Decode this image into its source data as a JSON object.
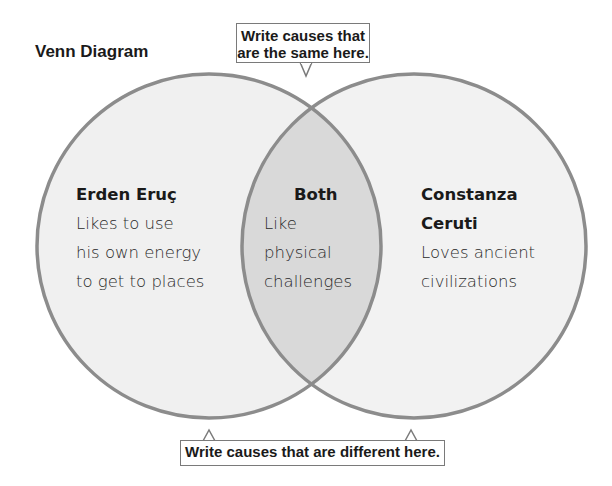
{
  "title": "Venn Diagram",
  "callouts": {
    "top": {
      "line1": "Write causes that",
      "line2": "are the same here."
    },
    "bottom": "Write causes that are different here."
  },
  "sections": {
    "left": {
      "heading": "Erden Eruç",
      "lines": [
        "Likes to use",
        "his own energy",
        "to get to places"
      ]
    },
    "both": {
      "heading": "Both",
      "lines": [
        "Like",
        "physical",
        "challenges"
      ]
    },
    "right": {
      "heading_lines": [
        "Constanza",
        "Ceruti"
      ],
      "lines": [
        "Loves ancient",
        "civilizations"
      ]
    }
  },
  "colors": {
    "circle_fill": "#f0f0f0",
    "overlap_fill": "#d9d9d9",
    "circle_stroke": "#8c8c8c",
    "callout_border": "#7a7a7a",
    "text": "#1a1a1a"
  }
}
